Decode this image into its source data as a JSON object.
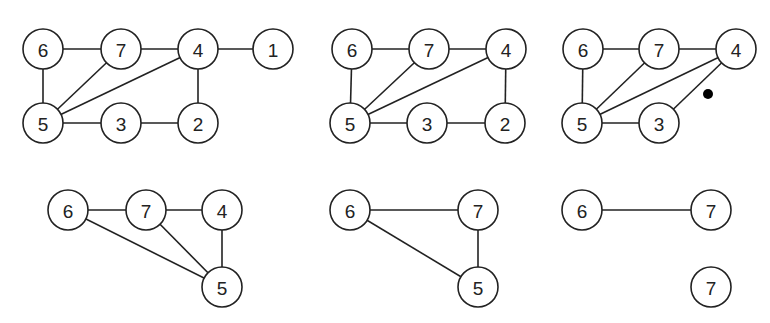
{
  "node_radius": 20,
  "graphs": [
    {
      "id": "graph-1",
      "nodes": [
        {
          "label": "6",
          "x": 43,
          "y": 49
        },
        {
          "label": "7",
          "x": 121,
          "y": 49
        },
        {
          "label": "4",
          "x": 198,
          "y": 49
        },
        {
          "label": "1",
          "x": 273,
          "y": 49
        },
        {
          "label": "5",
          "x": 43,
          "y": 123
        },
        {
          "label": "3",
          "x": 121,
          "y": 123
        },
        {
          "label": "2",
          "x": 198,
          "y": 123
        }
      ],
      "edges": [
        [
          0,
          1
        ],
        [
          1,
          2
        ],
        [
          2,
          3
        ],
        [
          0,
          4
        ],
        [
          1,
          4
        ],
        [
          2,
          4
        ],
        [
          2,
          6
        ],
        [
          4,
          5
        ],
        [
          5,
          6
        ]
      ]
    },
    {
      "id": "graph-2",
      "nodes": [
        {
          "label": "6",
          "x": 352,
          "y": 49
        },
        {
          "label": "7",
          "x": 429,
          "y": 49
        },
        {
          "label": "4",
          "x": 506,
          "y": 49
        },
        {
          "label": "5",
          "x": 350,
          "y": 123
        },
        {
          "label": "3",
          "x": 427,
          "y": 123
        },
        {
          "label": "2",
          "x": 505,
          "y": 123
        }
      ],
      "edges": [
        [
          0,
          1
        ],
        [
          1,
          2
        ],
        [
          0,
          3
        ],
        [
          1,
          3
        ],
        [
          2,
          3
        ],
        [
          2,
          5
        ],
        [
          3,
          4
        ],
        [
          4,
          5
        ]
      ]
    },
    {
      "id": "graph-3",
      "nodes": [
        {
          "label": "6",
          "x": 583,
          "y": 49
        },
        {
          "label": "7",
          "x": 659,
          "y": 49
        },
        {
          "label": "4",
          "x": 736,
          "y": 49
        },
        {
          "label": "5",
          "x": 582,
          "y": 123
        },
        {
          "label": "3",
          "x": 659,
          "y": 123
        }
      ],
      "edges": [
        [
          0,
          1
        ],
        [
          1,
          2
        ],
        [
          0,
          3
        ],
        [
          1,
          3
        ],
        [
          2,
          3
        ],
        [
          2,
          4
        ],
        [
          3,
          4
        ]
      ],
      "marker": {
        "x": 708,
        "y": 94,
        "r": 5
      }
    },
    {
      "id": "graph-4",
      "nodes": [
        {
          "label": "6",
          "x": 68,
          "y": 210
        },
        {
          "label": "7",
          "x": 146,
          "y": 210
        },
        {
          "label": "4",
          "x": 222,
          "y": 210
        },
        {
          "label": "5",
          "x": 222,
          "y": 287
        }
      ],
      "edges": [
        [
          0,
          1
        ],
        [
          1,
          2
        ],
        [
          0,
          3
        ],
        [
          1,
          3
        ],
        [
          2,
          3
        ]
      ]
    },
    {
      "id": "graph-5",
      "nodes": [
        {
          "label": "6",
          "x": 350,
          "y": 210
        },
        {
          "label": "7",
          "x": 478,
          "y": 210
        },
        {
          "label": "5",
          "x": 478,
          "y": 287
        }
      ],
      "edges": [
        [
          0,
          1
        ],
        [
          0,
          2
        ],
        [
          1,
          2
        ]
      ]
    },
    {
      "id": "graph-6",
      "nodes": [
        {
          "label": "6",
          "x": 582,
          "y": 210
        },
        {
          "label": "7",
          "x": 711,
          "y": 210
        },
        {
          "label": "7",
          "x": 711,
          "y": 287
        }
      ],
      "edges": [
        [
          0,
          1
        ]
      ]
    }
  ]
}
